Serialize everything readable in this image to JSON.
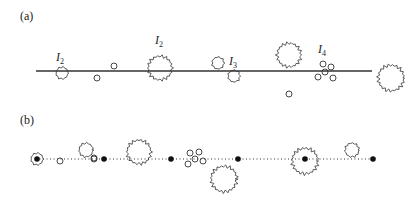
{
  "panel_a": {
    "label": "(a)",
    "line": {
      "x1": 36,
      "x2": 372,
      "y": 71
    },
    "labels": [
      {
        "text": "I",
        "sub": "2",
        "x": 60,
        "y": 61
      },
      {
        "text": "I",
        "sub": "2",
        "x": 159,
        "y": 44
      },
      {
        "text": "I",
        "sub": "3",
        "x": 233,
        "y": 65
      },
      {
        "text": "I",
        "sub": "4",
        "x": 322,
        "y": 53
      }
    ],
    "rough_circles": [
      {
        "cx": 62,
        "cy": 73,
        "r": 6
      },
      {
        "cx": 160,
        "cy": 68,
        "r": 12
      },
      {
        "cx": 218,
        "cy": 63,
        "r": 6
      },
      {
        "cx": 234,
        "cy": 76,
        "r": 6
      },
      {
        "cx": 289,
        "cy": 55,
        "r": 12
      },
      {
        "cx": 391,
        "cy": 78,
        "r": 13
      }
    ],
    "small_circles": [
      {
        "cx": 97,
        "cy": 78,
        "r": 3
      },
      {
        "cx": 114,
        "cy": 66,
        "r": 3
      },
      {
        "cx": 289,
        "cy": 94,
        "r": 3
      },
      {
        "cx": 323,
        "cy": 64,
        "r": 3
      },
      {
        "cx": 331,
        "cy": 67,
        "r": 3
      },
      {
        "cx": 325,
        "cy": 72,
        "r": 3
      },
      {
        "cx": 318,
        "cy": 77,
        "r": 3
      },
      {
        "cx": 333,
        "cy": 78,
        "r": 3
      }
    ]
  },
  "panel_b": {
    "label": "(b)",
    "line": {
      "x1": 36,
      "x2": 374,
      "y": 159,
      "style": "dotted"
    },
    "dots": [
      {
        "cx": 37,
        "cy": 159
      },
      {
        "cx": 104,
        "cy": 159
      },
      {
        "cx": 171,
        "cy": 159
      },
      {
        "cx": 238,
        "cy": 159
      },
      {
        "cx": 305,
        "cy": 159
      },
      {
        "cx": 373,
        "cy": 159
      }
    ],
    "rough_circles": [
      {
        "cx": 37,
        "cy": 159,
        "r": 6
      },
      {
        "cx": 86,
        "cy": 150,
        "r": 7
      },
      {
        "cx": 139,
        "cy": 152,
        "r": 12
      },
      {
        "cx": 224,
        "cy": 179,
        "r": 13
      },
      {
        "cx": 305,
        "cy": 161,
        "r": 13
      },
      {
        "cx": 352,
        "cy": 150,
        "r": 7
      }
    ],
    "small_circles": [
      {
        "cx": 60,
        "cy": 161,
        "r": 3
      },
      {
        "cx": 94,
        "cy": 158,
        "r": 3
      },
      {
        "cx": 190,
        "cy": 153,
        "r": 3
      },
      {
        "cx": 199,
        "cy": 152,
        "r": 3
      },
      {
        "cx": 195,
        "cy": 159,
        "r": 3
      },
      {
        "cx": 188,
        "cy": 164,
        "r": 3
      },
      {
        "cx": 203,
        "cy": 161,
        "r": 3
      },
      {
        "cx": 94,
        "cy": 159,
        "r": 3
      }
    ]
  }
}
